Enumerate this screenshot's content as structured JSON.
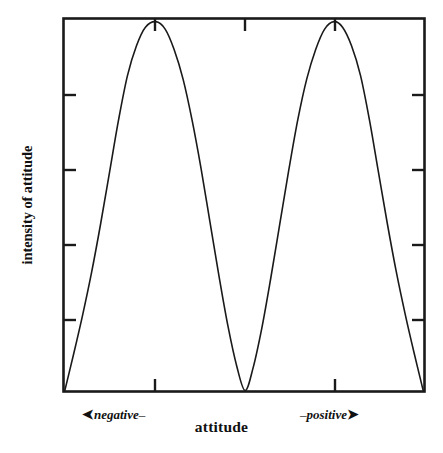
{
  "figure": {
    "background_color": "#ffffff",
    "ink_color": "#1a1a1a"
  },
  "axes": {
    "y_title": "intensity of attitude",
    "x_title": "attitude",
    "x_pole_negative": {
      "arrow": "➤",
      "dash": "–",
      "label": "negative"
    },
    "x_pole_positive": {
      "arrow": "➤",
      "dash": "–",
      "label": "positive"
    }
  },
  "chart_data": {
    "type": "line",
    "title": "",
    "subtitle": "",
    "xlabel": "attitude",
    "ylabel": "intensity of attitude",
    "grid": false,
    "legend": null,
    "frame": "box",
    "xlim": [
      0,
      1
    ],
    "ylim": [
      0,
      1
    ],
    "x_tick_labels": [],
    "y_tick_labels": [],
    "x_ticks_bottom": [
      0.254,
      0.751
    ],
    "x_ticks_top": [
      0.254,
      0.503,
      0.751
    ],
    "y_ticks_left": [
      0.193,
      0.393,
      0.594,
      0.794
    ],
    "y_ticks_right": [
      0.193,
      0.393,
      0.594,
      0.794
    ],
    "annotations": [
      {
        "text": "negative",
        "x": 0.13,
        "y": -0.09,
        "style": "italic-bold"
      },
      {
        "text": "positive",
        "x": 0.8,
        "y": -0.09,
        "style": "italic-bold"
      }
    ],
    "series": [
      {
        "name": "intensity of attitude",
        "color": "#1a1a1a",
        "line_width": 1.6,
        "x": [
          0.0,
          0.025,
          0.05,
          0.075,
          0.1,
          0.125,
          0.15,
          0.175,
          0.2,
          0.225,
          0.254,
          0.28,
          0.305,
          0.33,
          0.355,
          0.38,
          0.405,
          0.43,
          0.455,
          0.48,
          0.503,
          0.525,
          0.55,
          0.575,
          0.6,
          0.625,
          0.65,
          0.675,
          0.7,
          0.725,
          0.751,
          0.775,
          0.8,
          0.825,
          0.85,
          0.875,
          0.9,
          0.925,
          0.95,
          0.975,
          1.0
        ],
        "y": [
          0.0,
          0.1,
          0.205,
          0.32,
          0.45,
          0.59,
          0.73,
          0.85,
          0.93,
          0.98,
          0.995,
          0.975,
          0.92,
          0.84,
          0.73,
          0.6,
          0.455,
          0.31,
          0.175,
          0.065,
          0.0,
          0.06,
          0.17,
          0.305,
          0.45,
          0.595,
          0.73,
          0.84,
          0.92,
          0.975,
          0.995,
          0.98,
          0.93,
          0.85,
          0.73,
          0.59,
          0.45,
          0.32,
          0.205,
          0.1,
          0.0
        ]
      }
    ]
  }
}
